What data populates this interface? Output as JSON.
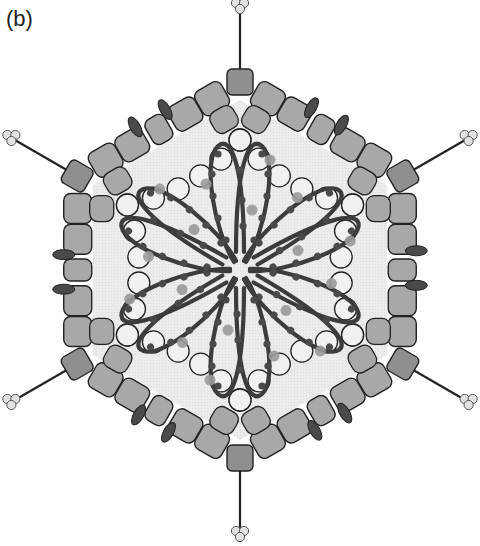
{
  "figure": {
    "panel_label": "(b)"
  },
  "colors": {
    "background": "#ffffff",
    "interior": "#ebebeb",
    "hexon": "#a8a8a8",
    "penton": "#8f8f8f",
    "minor_protein": "#4a4a4a",
    "core_protein": "#f1f1f1",
    "dna": "#3c3c3c",
    "dna_bead_dark": "#4a4a4a",
    "dna_bead_light": "#9a9a9a",
    "outline": "#222222",
    "fiber_knob": "#e2e2e2"
  },
  "geometry": {
    "center": [
      240,
      270
    ],
    "radius": 192,
    "vertex_angles_deg": [
      -90,
      -30,
      30,
      90,
      150,
      210
    ],
    "petal_count": 6
  },
  "components": [
    {
      "name": "fiber",
      "count": 6,
      "description": "fiber with trimeric knob at each vertex"
    },
    {
      "name": "penton base",
      "count": 6,
      "description": "darker square at each vertex"
    },
    {
      "name": "hexon",
      "description": "rounded grey capsomers along edges"
    },
    {
      "name": "minor protein",
      "count": 12,
      "description": "dark ellipses between hexons"
    },
    {
      "name": "core protein",
      "description": "ring of open circles inside capsid"
    },
    {
      "name": "DNA",
      "description": "six-lobed looped genome with bound proteins"
    }
  ]
}
